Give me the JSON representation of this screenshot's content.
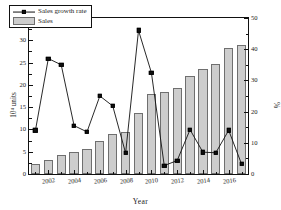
{
  "chart_data": {
    "type": "bar",
    "title": "",
    "xlabel": "Year",
    "ylabel": "10⁴ units",
    "ylabel_right": "%",
    "grid": false,
    "legend_position": "top-left",
    "categories": [
      "2001",
      "2002",
      "2003",
      "2004",
      "2005",
      "2006",
      "2007",
      "2008",
      "2009",
      "2010",
      "2011",
      "2012",
      "2013",
      "2014",
      "2015",
      "2016",
      "2017"
    ],
    "ylim": [
      0,
      35
    ],
    "ylim_right": [
      0,
      50
    ],
    "yticks": [
      "0",
      "5",
      "10",
      "15",
      "20",
      "25",
      "30",
      "35"
    ],
    "yticks_right": [
      "0",
      "10",
      "20",
      "30",
      "40",
      "50"
    ],
    "xticks": [
      "2002",
      "2004",
      "2006",
      "2008",
      "2010",
      "2012",
      "2014",
      "2016"
    ],
    "series": [
      {
        "name": "Sales",
        "kind": "bar",
        "axis": "left",
        "color": "#cdcdcd",
        "edge_color": "#6f6f6f",
        "values": [
          2.3,
          3.2,
          4.3,
          5.0,
          5.7,
          7.3,
          8.9,
          9.4,
          13.8,
          18.0,
          18.5,
          19.4,
          22.1,
          23.6,
          24.6,
          28.2,
          29.0
        ]
      },
      {
        "name": "Sales growth rate",
        "kind": "line",
        "axis": "right",
        "color": "#111111",
        "marker": "square",
        "values": [
          14.0,
          37.0,
          35.0,
          15.5,
          13.5,
          25.0,
          21.8,
          6.7,
          46.0,
          32.5,
          2.7,
          4.3,
          14.2,
          7.0,
          6.8,
          14.0,
          3.2
        ]
      }
    ]
  },
  "legend": {
    "entries": [
      {
        "label": "Sales growth rate"
      },
      {
        "label": "Sales"
      }
    ]
  },
  "axes": {
    "x_title": "Year",
    "y_title_left": "10⁴ units",
    "y_title_right": "%"
  }
}
